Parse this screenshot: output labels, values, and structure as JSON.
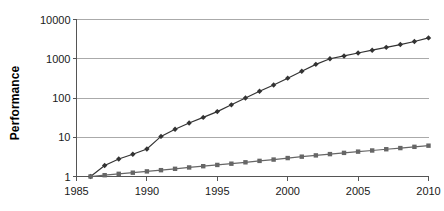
{
  "chart_data": {
    "type": "line",
    "title": "",
    "subtitle": "",
    "xlabel": "",
    "ylabel": "Performance",
    "yscale": "log",
    "ylim": [
      1,
      10000
    ],
    "xlim": [
      1985,
      2010
    ],
    "grid": true,
    "legend": "none",
    "y_ticks": [
      {
        "value": 10000,
        "label": "10000"
      },
      {
        "value": 1000,
        "label": "1000"
      },
      {
        "value": 100,
        "label": "100"
      },
      {
        "value": 10,
        "label": "10"
      },
      {
        "value": 1,
        "label": "1"
      }
    ],
    "x_ticks": [
      {
        "value": 1985,
        "label": "1985"
      },
      {
        "value": 1990,
        "label": "1990"
      },
      {
        "value": 1995,
        "label": "1995"
      },
      {
        "value": 2000,
        "label": "2000"
      },
      {
        "value": 2005,
        "label": "2005"
      },
      {
        "value": 2010,
        "label": "2010"
      }
    ],
    "x": [
      1986,
      1987,
      1988,
      1989,
      1990,
      1991,
      1992,
      1993,
      1994,
      1995,
      1996,
      1997,
      1998,
      1999,
      2000,
      2001,
      2002,
      2003,
      2004,
      2005,
      2006,
      2007,
      2008,
      2009,
      2010
    ],
    "series": [
      {
        "name": "high-performance-series",
        "marker": "diamond",
        "color": "#333333",
        "values": [
          1.0,
          1.9,
          2.8,
          3.7,
          5.0,
          10.5,
          16,
          23,
          32,
          45,
          67,
          100,
          148,
          215,
          320,
          480,
          720,
          1000,
          1180,
          1400,
          1650,
          1950,
          2300,
          2750,
          3400
        ]
      },
      {
        "name": "baseline-series",
        "marker": "square",
        "color": "#666666",
        "values": [
          1.0,
          1.08,
          1.17,
          1.25,
          1.35,
          1.45,
          1.57,
          1.7,
          1.83,
          1.97,
          2.12,
          2.3,
          2.5,
          2.7,
          2.95,
          3.2,
          3.45,
          3.72,
          4.0,
          4.3,
          4.6,
          4.95,
          5.3,
          5.7,
          6.1
        ]
      }
    ],
    "colors": {
      "gridline": "#aaaaaa",
      "axis": "#555555",
      "background": "#ffffff",
      "text": "#1a1a1a"
    }
  }
}
